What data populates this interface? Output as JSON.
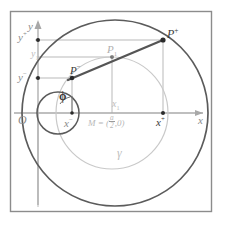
{
  "figure": {
    "kind": "geometry-diagram",
    "background": "#ffffff",
    "frame_color": "#8c8c8c",
    "colors": {
      "axis": "#a8a8a8",
      "big_circle": "#595959",
      "small_circle": "#595959",
      "gamma_circle": "#c3c3c3",
      "chord": "#555555",
      "guide_line": "#b5b5b5",
      "point": "#2b2b2b",
      "label_gray": "#8a8a8a",
      "label_dark": "#3a3a3a"
    },
    "axes": {
      "x_label": "x",
      "y_label": "y",
      "origin_label": "O"
    },
    "points": [
      {
        "id": "P_plus",
        "label": "P",
        "superscript": "+",
        "x": 163,
        "y": 40,
        "emphasis": "dark"
      },
      {
        "id": "P_minus",
        "label": "P",
        "superscript": "−",
        "x": 72,
        "y": 78,
        "emphasis": "dark"
      },
      {
        "id": "P_one",
        "label": "P",
        "subscript": "1",
        "x": 112,
        "y": 57,
        "emphasis": "gray"
      },
      {
        "id": "M",
        "label": "M",
        "x": 112,
        "y": 113,
        "emphasis": "gray"
      }
    ],
    "tick_labels": {
      "y_plus": {
        "base": "y",
        "sup": "+",
        "x": 20,
        "y": 30
      },
      "y_one": {
        "base": "y",
        "sub": "1",
        "x": 30,
        "y": 53
      },
      "y_minus": {
        "base": "y",
        "sup": "−",
        "x": 20,
        "y": 80
      },
      "x_minus": {
        "base": "x",
        "sup": "−",
        "x": 57,
        "y": 118
      },
      "x_one": {
        "base": "x",
        "sub": "1",
        "x": 106,
        "y": 100
      },
      "x_plus": {
        "base": "x",
        "sup": "+",
        "x": 149,
        "y": 118
      }
    },
    "annotations": {
      "angle": "ϕ",
      "curve_gamma": "γ",
      "center_expr_lead": "M = (",
      "center_expr_num": "a",
      "center_expr_den": "2",
      "center_expr_tail": ",0)"
    },
    "circles": {
      "big": {
        "cx": 115,
        "cy": 113,
        "r": 93,
        "label": ""
      },
      "gamma": {
        "cx": 112,
        "cy": 113,
        "r": 56,
        "label": "γ"
      },
      "small": {
        "cx": 58,
        "cy": 113,
        "r": 21,
        "label": ""
      }
    }
  }
}
